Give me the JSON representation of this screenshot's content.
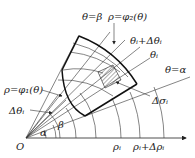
{
  "figure": {
    "type": "polar-region-partition",
    "labels": {
      "theta_beta": "θ=β",
      "rho_phi2": "ρ=φ₂(θ)",
      "theta_i_plus": "θᵢ+Δθᵢ",
      "theta_i": "θᵢ",
      "theta_alpha": "θ=α",
      "rho_phi1": "ρ=φ₁(θ)",
      "delta_theta": "Δθᵢ",
      "delta_sigma": "Δσᵢ",
      "origin": "O",
      "alpha": "α",
      "beta": "β",
      "rho_i": "ρᵢ",
      "rho_i_plus": "ρᵢ+Δρᵢ"
    },
    "colors": {
      "stroke": "#222222",
      "background": "#ffffff",
      "hatch": "#333333"
    }
  }
}
